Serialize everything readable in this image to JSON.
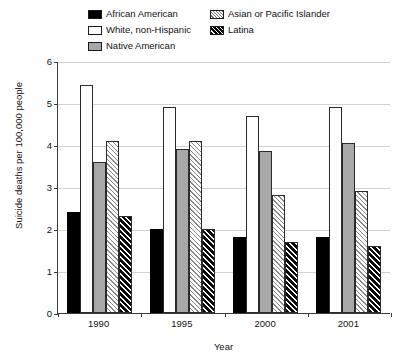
{
  "chart_data": {
    "type": "bar",
    "title": "",
    "xlabel": "Year",
    "ylabel": "Suicide deaths per 100,000 people",
    "categories": [
      "1990",
      "1995",
      "2000",
      "2001"
    ],
    "ylim": [
      0,
      6
    ],
    "yticks": [
      "0",
      "1",
      "2",
      "3",
      "4",
      "5",
      "6"
    ],
    "grid": true,
    "legend_position": "top",
    "series": [
      {
        "name": "African American",
        "style": "solid-black",
        "color": "#000000",
        "values": [
          2.4,
          2.0,
          1.8,
          1.8
        ]
      },
      {
        "name": "White, non-Hispanic",
        "style": "solid-white",
        "color": "#ffffff",
        "values": [
          5.43,
          4.9,
          4.7,
          4.9
        ]
      },
      {
        "name": "Native American",
        "style": "solid-gray",
        "color": "#a8a8a8",
        "values": [
          3.6,
          3.9,
          3.85,
          4.05
        ]
      },
      {
        "name": "Asian or Pacific Islander",
        "style": "hatch-light",
        "color": "#8a8a8a",
        "values": [
          4.1,
          4.1,
          2.8,
          2.9
        ]
      },
      {
        "name": "Latina",
        "style": "hatch-dark",
        "color": "#0a0a0a",
        "values": [
          2.3,
          2.0,
          1.7,
          1.6
        ]
      }
    ]
  },
  "legend": {
    "items": [
      {
        "label": "African American",
        "swatch": "sw-black"
      },
      {
        "label": "Asian or Pacific Islander",
        "swatch": "sw-hatch-light"
      },
      {
        "label": "White, non-Hispanic",
        "swatch": "sw-white"
      },
      {
        "label": "Latina",
        "swatch": "sw-hatch-dark"
      },
      {
        "label": "Native American",
        "swatch": "sw-gray"
      }
    ]
  },
  "axes": {
    "y_title": "Suicide deaths per 100,000 people",
    "x_title": "Year"
  }
}
